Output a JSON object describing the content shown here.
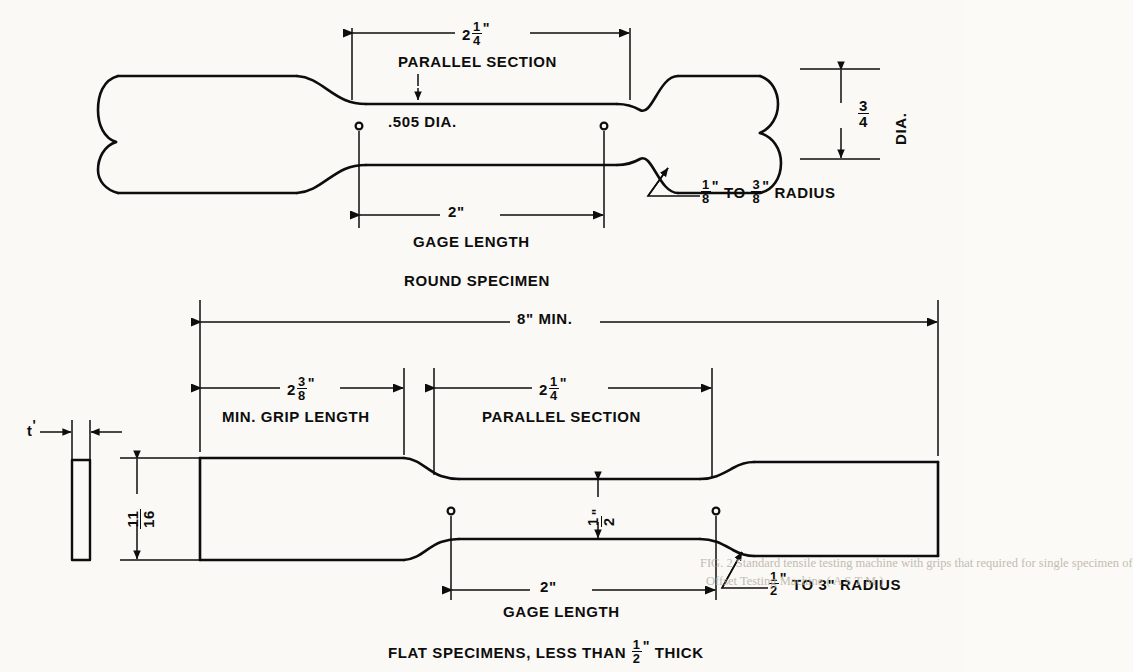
{
  "figure": {
    "kind": "engineering-drawing",
    "line_color": "#0d0d0d",
    "paper_color": "#faf9f6"
  },
  "round_specimen": {
    "caption": "ROUND SPECIMEN",
    "parallel_section": {
      "value_whole": "2",
      "value_num": "1",
      "value_den": "4",
      "unit": "\"",
      "label": "PARALLEL SECTION"
    },
    "diameter": {
      "text": ".505 DIA."
    },
    "gage_length": {
      "value": "2\"",
      "label": "GAGE LENGTH"
    },
    "grip_diameter": {
      "num": "3",
      "den": "4",
      "unit": "\"",
      "label": "DIA."
    },
    "fillet_radius": {
      "from_num": "1",
      "from_den": "8",
      "to_num": "3",
      "to_den": "8",
      "unit": "\"",
      "connector": "TO",
      "label": "RADIUS"
    }
  },
  "flat_specimen": {
    "caption_pre": "FLAT SPECIMENS, LESS THAN",
    "caption_num": "1",
    "caption_den": "2",
    "caption_unit": "\"",
    "caption_post": "THICK",
    "overall_length": {
      "text": "8\" MIN."
    },
    "grip_length": {
      "value_whole": "2",
      "value_num": "3",
      "value_den": "8",
      "unit": "\"",
      "label": "MIN. GRIP LENGTH"
    },
    "parallel_section": {
      "value_whole": "2",
      "value_num": "1",
      "value_den": "4",
      "unit": "\"",
      "label": "PARALLEL SECTION"
    },
    "grip_width": {
      "num": "11",
      "den": "16"
    },
    "reduced_width": {
      "num": "1",
      "den": "2",
      "unit": "\""
    },
    "thickness": {
      "text": "t"
    },
    "gage_length": {
      "value": "2\"",
      "label": "GAGE LENGTH"
    },
    "fillet_radius": {
      "from_num": "1",
      "from_den": "2",
      "to": "3\"",
      "unit": "\"",
      "connector": "TO",
      "label": "RADIUS"
    }
  },
  "bleedthrough": {
    "line1": "FIG. 2  Standard tensile testing machine with grips that required for single specimen of",
    "line2": "Offset Testing Machine  ( A S T M )"
  }
}
